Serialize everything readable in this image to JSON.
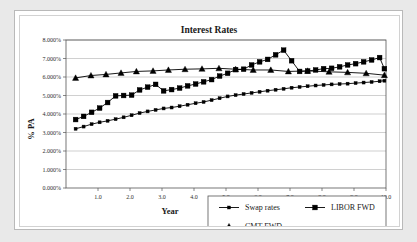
{
  "chart_data": {
    "type": "line",
    "title": "Interest Rates",
    "xlabel": "Year",
    "ylabel": "% PA",
    "xlim": [
      0,
      10
    ],
    "ylim": [
      0,
      0.08
    ],
    "grid": true,
    "legend_position": "bottom-right",
    "xticks": [
      "1.0",
      "2.0",
      "3.0",
      "4.0",
      "5.0",
      "6.0",
      "7.0",
      "8.0",
      "9.0",
      "10.0"
    ],
    "xtick_values": [
      1,
      2,
      3,
      4,
      5,
      6,
      7,
      8,
      9,
      10
    ],
    "yticks": [
      "0.000%",
      "1.000%",
      "2.000%",
      "3.000%",
      "4.000%",
      "5.000%",
      "6.000%",
      "7.000%",
      "8.000%"
    ],
    "ytick_values": [
      0,
      1,
      2,
      3,
      4,
      5,
      6,
      7,
      8
    ],
    "series": [
      {
        "name": "Swap rates",
        "marker": "small-square",
        "x": [
          0.3,
          0.55,
          0.8,
          1.05,
          1.3,
          1.55,
          1.8,
          2.05,
          2.3,
          2.55,
          2.8,
          3.05,
          3.3,
          3.55,
          3.8,
          4.05,
          4.3,
          4.55,
          4.8,
          5.05,
          5.3,
          5.55,
          5.8,
          6.05,
          6.3,
          6.55,
          6.8,
          7.05,
          7.3,
          7.55,
          7.8,
          8.05,
          8.3,
          8.55,
          8.8,
          9.05,
          9.3,
          9.55,
          9.8,
          9.95
        ],
        "values": [
          3.2,
          3.32,
          3.45,
          3.55,
          3.63,
          3.72,
          3.82,
          3.93,
          4.05,
          4.14,
          4.22,
          4.3,
          4.35,
          4.42,
          4.5,
          4.58,
          4.65,
          4.75,
          4.85,
          4.95,
          5.02,
          5.08,
          5.14,
          5.2,
          5.26,
          5.31,
          5.36,
          5.42,
          5.46,
          5.5,
          5.54,
          5.57,
          5.6,
          5.62,
          5.64,
          5.67,
          5.7,
          5.73,
          5.77,
          5.8
        ]
      },
      {
        "name": "LIBOR FWD",
        "marker": "square",
        "x": [
          0.3,
          0.55,
          0.8,
          1.05,
          1.3,
          1.55,
          1.8,
          2.05,
          2.3,
          2.55,
          2.8,
          3.05,
          3.3,
          3.55,
          3.8,
          4.05,
          4.3,
          4.55,
          4.8,
          5.05,
          5.3,
          5.55,
          5.8,
          6.05,
          6.3,
          6.55,
          6.8,
          7.05,
          7.3,
          7.55,
          7.8,
          8.05,
          8.3,
          8.55,
          8.8,
          9.05,
          9.3,
          9.55,
          9.8,
          9.95
        ],
        "values": [
          3.7,
          3.87,
          4.09,
          4.32,
          4.62,
          4.98,
          5.0,
          5.02,
          5.3,
          5.45,
          5.6,
          5.25,
          5.32,
          5.4,
          5.52,
          5.62,
          5.74,
          5.86,
          6.05,
          6.2,
          6.4,
          6.42,
          6.65,
          6.82,
          6.95,
          7.2,
          7.45,
          6.88,
          6.3,
          6.32,
          6.38,
          6.45,
          6.47,
          6.55,
          6.65,
          6.72,
          6.82,
          6.92,
          7.05,
          6.45
        ]
      },
      {
        "name": "CMT FWD",
        "marker": "triangle",
        "x": [
          0.3,
          0.78,
          1.25,
          1.72,
          2.2,
          2.72,
          3.2,
          3.72,
          4.25,
          4.78,
          5.3,
          5.85,
          6.4,
          6.95,
          7.55,
          8.22,
          8.8,
          9.38,
          9.95
        ],
        "values": [
          5.95,
          6.08,
          6.14,
          6.22,
          6.3,
          6.33,
          6.38,
          6.42,
          6.44,
          6.47,
          6.42,
          6.38,
          6.38,
          6.3,
          6.33,
          6.28,
          6.25,
          6.2,
          6.1
        ]
      }
    ]
  }
}
